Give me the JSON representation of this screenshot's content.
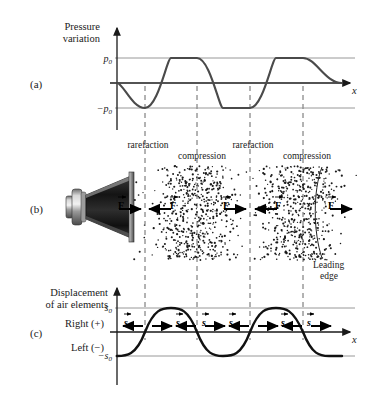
{
  "figure": {
    "width": 371,
    "height": 395
  },
  "panels": [
    {
      "id": "a",
      "letter": "(a)"
    },
    {
      "id": "b",
      "letter": "(b)"
    },
    {
      "id": "c",
      "letter": "(c)"
    }
  ],
  "panel_a": {
    "ylabel_line1": "Pressure",
    "ylabel_line2": "variation",
    "ytick_pos": "p0",
    "ytick_neg": "−p0",
    "ytick_pos_base": "p",
    "ytick_pos_sub": "0",
    "ytick_neg_base": "−p",
    "ytick_neg_sub": "0",
    "xaxis_label": "x"
  },
  "panel_b": {
    "region_labels": [
      {
        "text": "rarefaction",
        "x": 148,
        "y": 148
      },
      {
        "text": "compression",
        "x": 200,
        "y": 158
      },
      {
        "text": "rarefaction",
        "x": 253,
        "y": 148
      },
      {
        "text": "compression",
        "x": 305,
        "y": 158
      }
    ],
    "force_label": "F",
    "force_arrows": [
      {
        "direction": "right",
        "x": 126
      },
      {
        "direction": "left",
        "x": 178
      },
      {
        "direction": "right",
        "x": 231
      },
      {
        "direction": "left",
        "x": 283
      },
      {
        "direction": "right",
        "x": 336
      }
    ],
    "leading_edge_line1": "Leading",
    "leading_edge_line2": "edge",
    "speaker_name": "loudspeaker"
  },
  "panel_c": {
    "ylabel_line1": "Displacement",
    "ylabel_line2": "of air elements",
    "direction_positive": "Right (+)",
    "direction_negative": "Left (−)",
    "ytick_pos_base": "s",
    "ytick_pos_sub": "0",
    "ytick_neg_base": "−s",
    "ytick_neg_sub": "0",
    "xaxis_label": "x",
    "displacement_label": "s",
    "displacement_arrows": [
      {
        "direction": "left",
        "label_side": "left"
      },
      {
        "direction": "right",
        "label_side": "right"
      },
      {
        "direction": "left",
        "label_side": "left"
      },
      {
        "direction": "right",
        "label_side": "right"
      },
      {
        "direction": "left",
        "label_side": "left"
      }
    ]
  },
  "chart_data": [
    {
      "type": "line",
      "id": "pressure-variation",
      "title": "Pressure variation",
      "xlabel": "x",
      "ylabel": "Pressure variation",
      "ylim": [
        -1,
        1
      ],
      "ytick_labels": [
        "p0",
        "-p0"
      ],
      "ytick_values": [
        1,
        -1
      ],
      "waveform": "negative-sine",
      "description": "p(x) = -p0 sin(2*pi*x/lambda); begins at 0 descending to a trough",
      "wavelength_px": 105,
      "amplitude_label": "p0",
      "grid": false,
      "x": [
        0,
        0.125,
        0.25,
        0.375,
        0.5,
        0.625,
        0.75,
        0.875,
        1.0,
        1.125,
        1.25,
        1.375,
        1.5,
        1.625,
        1.75,
        1.875,
        2.0
      ],
      "y": [
        0,
        -0.707,
        -1,
        -0.707,
        0,
        0.707,
        1,
        0.707,
        0,
        -0.707,
        -1,
        -0.707,
        0,
        0.707,
        1,
        0.707,
        0
      ]
    },
    {
      "type": "line",
      "id": "displacement-of-air-elements",
      "title": "Displacement of air elements",
      "xlabel": "x",
      "ylabel": "Displacement of air elements",
      "ylim": [
        -1,
        1
      ],
      "ytick_labels": [
        "s0",
        "-s0"
      ],
      "ytick_values": [
        1,
        -1
      ],
      "waveform": "negative-cosine",
      "description": "s(x) = -s0 cos(2*pi*x/lambda); begins at -s0, 90 degrees out of phase with pressure",
      "wavelength_px": 105,
      "amplitude_label": "s0",
      "grid": false,
      "x": [
        0,
        0.125,
        0.25,
        0.375,
        0.5,
        0.625,
        0.75,
        0.875,
        1.0,
        1.125,
        1.25,
        1.375,
        1.5,
        1.625,
        1.75,
        1.875,
        2.0
      ],
      "y": [
        -1,
        -0.707,
        0,
        0.707,
        1,
        0.707,
        0,
        -0.707,
        -1,
        -0.707,
        0,
        0.707,
        1,
        0.707,
        0,
        -0.707,
        -1
      ]
    }
  ],
  "dashed_guides": {
    "x_positions": [
      145,
      197,
      250,
      303
    ],
    "note": "vertical dashed lines connecting pressure extremes through the medium to displacement zeros"
  }
}
